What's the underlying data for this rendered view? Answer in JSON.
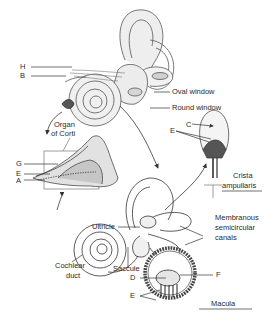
{
  "diagram": {
    "labels": {
      "H": "H",
      "B": "B",
      "oval_window": "Oval window",
      "round_window": "Round window",
      "organ_of_corti_1": "Organ",
      "organ_of_corti_2": "of Corti",
      "G": "G",
      "E_corti": "E",
      "A": "A",
      "C": "C",
      "E_crista": "E",
      "crista_1": "Crista",
      "crista_2": "ampullaris",
      "utricle": "Ultricle",
      "membranous_1": "Membranous",
      "membranous_2": "semicircular",
      "membranous_3": "canals",
      "cochlear_1": "Cochlear",
      "cochlear_2": "duct",
      "saccule": "Saccule",
      "D": "D",
      "F": "F",
      "E_macula": "E",
      "macula": "Macula"
    },
    "colors": {
      "line": "#333333",
      "fill_light": "#e6e6e6",
      "fill_mid": "#bcbcbc",
      "background": "#ffffff"
    }
  }
}
